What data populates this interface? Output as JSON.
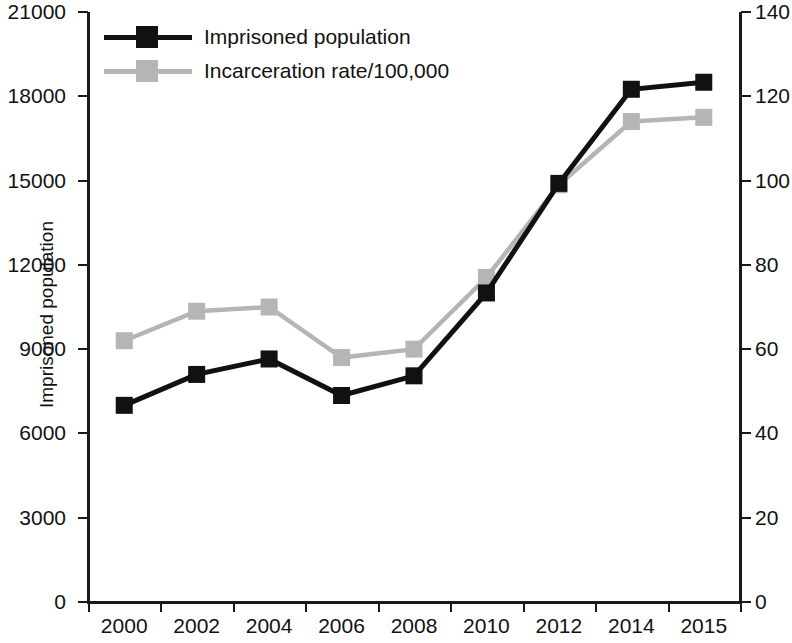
{
  "chart_data": {
    "type": "line",
    "title": "",
    "xlabel": "",
    "ylabel": "Imprisoned population",
    "y2label": "",
    "categories": [
      "2000",
      "2002",
      "2004",
      "2006",
      "2008",
      "2010",
      "2012",
      "2014",
      "2015"
    ],
    "series": [
      {
        "name": "Imprisoned population",
        "axis": "left",
        "color": "#111111",
        "marker": "square",
        "values": [
          7000,
          8100,
          8650,
          7350,
          8050,
          11000,
          14900,
          18250,
          18500
        ]
      },
      {
        "name": "Incarceration rate/100,000",
        "axis": "right",
        "color": "#b5b5b5",
        "marker": "square",
        "values": [
          62,
          69,
          70,
          58,
          60,
          77,
          99,
          114,
          115
        ]
      }
    ],
    "left_axis": {
      "label": "Imprisoned population",
      "ticks": [
        "0",
        "3000",
        "6000",
        "9000",
        "12000",
        "15000",
        "18000",
        "21000"
      ],
      "tick_values": [
        0,
        3000,
        6000,
        9000,
        12000,
        15000,
        18000,
        21000
      ],
      "ylim": [
        0,
        21000
      ]
    },
    "right_axis": {
      "label": "",
      "ticks": [
        "0",
        "20",
        "40",
        "60",
        "80",
        "100",
        "120",
        "140"
      ],
      "tick_values": [
        0,
        20,
        40,
        60,
        80,
        100,
        120,
        140
      ],
      "ylim": [
        0,
        140
      ]
    },
    "grid": false,
    "legend_position": "top-left",
    "legend": [
      {
        "label": "Imprisoned population",
        "color": "#111111"
      },
      {
        "label": "Incarceration rate/100,000",
        "color": "#b5b5b5"
      }
    ]
  }
}
